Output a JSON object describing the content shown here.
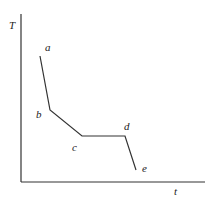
{
  "diagram": {
    "type": "cooling-curve",
    "axes": {
      "y_label": "T",
      "x_label": "t",
      "origin": [
        21,
        182
      ],
      "y_top": 14,
      "x_right": 205
    },
    "points": [
      {
        "id": "a",
        "label": "a",
        "x": 40,
        "y": 56,
        "label_x": 45,
        "label_y": 51
      },
      {
        "id": "b",
        "label": "b",
        "x": 50,
        "y": 110,
        "label_x": 36,
        "label_y": 118
      },
      {
        "id": "c",
        "label": "c",
        "x": 82,
        "y": 136,
        "label_x": 72,
        "label_y": 151
      },
      {
        "id": "d",
        "label": "d",
        "x": 125,
        "y": 136,
        "label_x": 124,
        "label_y": 130
      },
      {
        "id": "e",
        "label": "e",
        "x": 136,
        "y": 170,
        "label_x": 142,
        "label_y": 172
      }
    ],
    "colors": {
      "line": "#333333",
      "text": "#222222",
      "background": "#ffffff"
    }
  }
}
